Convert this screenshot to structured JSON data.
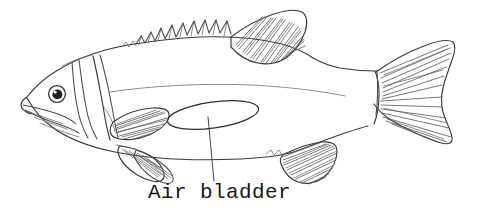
{
  "figure": {
    "background_color": "#ffffff",
    "ink_color": "#4a4a4a",
    "canvas": {
      "width": 478,
      "height": 218
    }
  },
  "labels": [
    {
      "id": "air-bladder",
      "text": "Air bladder",
      "x": 148,
      "y": 180,
      "font_style": "typewriter-serif",
      "color": "#181818"
    }
  ],
  "annotations": {
    "leader_line": {
      "from_x": 208,
      "from_y": 117,
      "to_x": 214,
      "to_y": 181,
      "color": "#3b3b3b"
    },
    "callout_shape": {
      "name": "air-bladder-ellipse",
      "type": "ellipse",
      "center_x": 213,
      "center_y": 115,
      "radius_x": 46,
      "radius_y": 13,
      "rotation_deg": -8,
      "color": "#2e2e2e"
    }
  },
  "anatomy_parts": [
    {
      "name": "head",
      "label": "head"
    },
    {
      "name": "eye",
      "label": "eye"
    },
    {
      "name": "mouth",
      "label": "mouth"
    },
    {
      "name": "operculum",
      "label": "gill cover"
    },
    {
      "name": "spiny-dorsal-fin",
      "label": "spiny dorsal fin"
    },
    {
      "name": "soft-dorsal-fin",
      "label": "soft dorsal fin"
    },
    {
      "name": "pectoral-fin",
      "label": "pectoral fin"
    },
    {
      "name": "pelvic-fin",
      "label": "pelvic fin"
    },
    {
      "name": "anal-fin",
      "label": "anal fin"
    },
    {
      "name": "caudal-fin",
      "label": "caudal fin"
    },
    {
      "name": "air-bladder",
      "label": "air bladder"
    },
    {
      "name": "lateral-line",
      "label": "lateral line"
    }
  ]
}
